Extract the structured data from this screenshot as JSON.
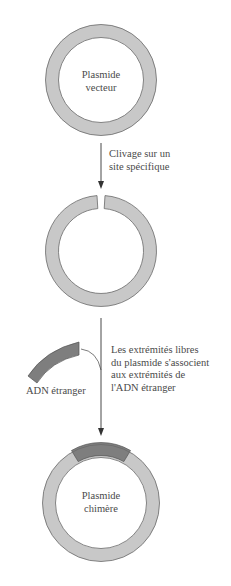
{
  "labels": {
    "plasmid_vector": [
      "Plasmide",
      "vecteur"
    ],
    "cleavage_step": [
      "Clivage sur un",
      "site spécifique"
    ],
    "ligation_step": [
      "Les extrémités libres",
      "du plasmide s'associent",
      "aux extrémités de",
      "l'ADN étranger"
    ],
    "foreign_dna": "ADN étranger",
    "chimeric_plasmid": [
      "Plasmide",
      "chimère"
    ]
  },
  "colors": {
    "plasmid_fill": "#c8c8c8",
    "plasmid_stroke": "#6a6a6a",
    "foreign_dna_fill": "#7e7e7e",
    "arrow": "#333333",
    "text": "#4a4a4a"
  }
}
